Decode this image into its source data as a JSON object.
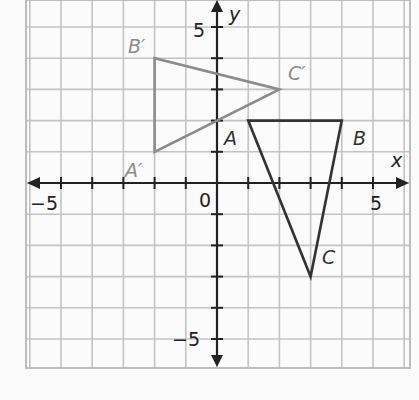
{
  "diagram": {
    "type": "coordinate-plane-transformation",
    "x_axis_label": "x",
    "y_axis_label": "y",
    "origin_label": "0",
    "tick_labels": {
      "x_neg": "−5",
      "x_pos": "5",
      "y_pos": "5",
      "y_neg": "−5"
    },
    "grid": {
      "xmin": -6,
      "xmax": 6,
      "ymin": -6,
      "ymax": 6,
      "step": 1
    },
    "colors": {
      "grid": "#c4c4c4",
      "axis": "#222222",
      "original": "#333333",
      "image": "#8c8c8c"
    },
    "triangles": [
      {
        "name": "original",
        "vertices": [
          {
            "label": "A",
            "x": 1,
            "y": 2
          },
          {
            "label": "B",
            "x": 4,
            "y": 2
          },
          {
            "label": "C",
            "x": 3,
            "y": -3
          }
        ]
      },
      {
        "name": "image",
        "vertices": [
          {
            "label": "A′",
            "x": -2,
            "y": 1
          },
          {
            "label": "B′",
            "x": -2,
            "y": 4
          },
          {
            "label": "C′",
            "x": 2,
            "y": 3
          }
        ]
      }
    ]
  },
  "labels": {
    "A": "A",
    "B": "B",
    "C": "C",
    "A_prime": "A′",
    "B_prime": "B′",
    "C_prime": "C′"
  }
}
